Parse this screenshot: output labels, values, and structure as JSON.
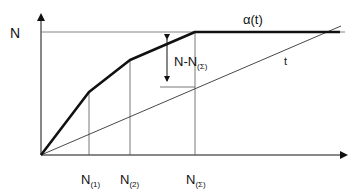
{
  "diagram": {
    "y_axis_label": "N",
    "curve_label": "α(t)",
    "line_label": "t",
    "difference_label": {
      "main": "N-N",
      "sub": "(Σ)"
    },
    "x_ticks": [
      {
        "main": "N",
        "sub": "(1)"
      },
      {
        "main": "N",
        "sub": "(2)"
      },
      {
        "main": "N",
        "sub": "(Σ)"
      }
    ],
    "colors": {
      "ink": "#111111",
      "thin": "#444444",
      "background": "#ffffff"
    }
  }
}
